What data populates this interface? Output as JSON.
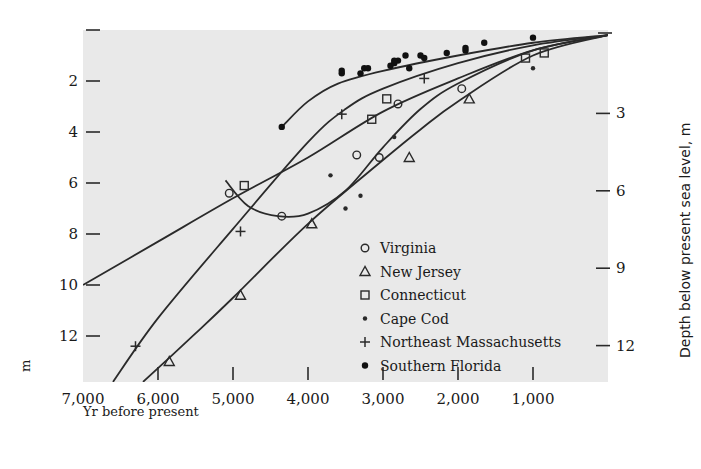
{
  "chart_data": {
    "type": "scatter",
    "title": "",
    "xlabel": "Yr before present",
    "ylabel_left": "m",
    "ylabel_right": "Depth below present sea level, m",
    "x_axis": {
      "range": [
        7000,
        0
      ],
      "reversed": true,
      "ticks": [
        7000,
        6000,
        5000,
        4000,
        3000,
        2000,
        1000
      ],
      "tick_labels": [
        "7,000",
        "6,000",
        "5,000",
        "4,000",
        "3,000",
        "2,000",
        "1,000"
      ]
    },
    "y_axis_left": {
      "range": [
        0,
        13.8
      ],
      "inverted": true,
      "ticks": [
        0,
        2,
        4,
        6,
        8,
        10,
        12
      ],
      "tick_labels": [
        "",
        "2",
        "4",
        "6",
        "8",
        "10",
        "12"
      ]
    },
    "y_axis_right": {
      "ticks": [
        3,
        6,
        9,
        12
      ],
      "tick_labels": [
        "3",
        "6",
        "9",
        "12"
      ]
    },
    "grid": false,
    "legend_position": "inside-lower-right",
    "legend": [
      {
        "name": "Virginia",
        "marker": "open-circle"
      },
      {
        "name": "New Jersey",
        "marker": "open-triangle"
      },
      {
        "name": "Connecticut",
        "marker": "open-square"
      },
      {
        "name": "Cape Cod",
        "marker": "small-dot"
      },
      {
        "name": "Northeast Massachusetts",
        "marker": "plus"
      },
      {
        "name": "Southern Florida",
        "marker": "filled-circle"
      }
    ],
    "series": [
      {
        "name": "Virginia",
        "marker": "open-circle",
        "points": [
          [
            5050,
            6.4
          ],
          [
            4350,
            7.3
          ],
          [
            3350,
            4.9
          ],
          [
            3050,
            5.0
          ],
          [
            2800,
            2.9
          ],
          [
            1950,
            2.3
          ]
        ]
      },
      {
        "name": "New Jersey",
        "marker": "open-triangle",
        "points": [
          [
            5850,
            13.0
          ],
          [
            4900,
            10.4
          ],
          [
            3950,
            7.6
          ],
          [
            2650,
            5.0
          ],
          [
            1850,
            2.7
          ]
        ]
      },
      {
        "name": "Connecticut",
        "marker": "open-square",
        "points": [
          [
            4850,
            6.1
          ],
          [
            3150,
            3.5
          ],
          [
            2950,
            2.7
          ],
          [
            1100,
            1.1
          ],
          [
            850,
            0.9
          ]
        ]
      },
      {
        "name": "Cape Cod",
        "marker": "small-dot",
        "points": [
          [
            3700,
            5.7
          ],
          [
            3300,
            6.5
          ],
          [
            2850,
            4.2
          ],
          [
            3500,
            7.0
          ],
          [
            1000,
            1.5
          ]
        ]
      },
      {
        "name": "Northeast Massachusetts",
        "marker": "plus",
        "points": [
          [
            6300,
            12.4
          ],
          [
            4900,
            7.9
          ],
          [
            3550,
            3.3
          ],
          [
            2450,
            1.9
          ]
        ]
      },
      {
        "name": "Southern Florida",
        "marker": "filled-circle",
        "points": [
          [
            4350,
            3.8
          ],
          [
            3550,
            1.7
          ],
          [
            3550,
            1.6
          ],
          [
            3300,
            1.7
          ],
          [
            3250,
            1.5
          ],
          [
            3200,
            1.5
          ],
          [
            2900,
            1.4
          ],
          [
            2850,
            1.3
          ],
          [
            2800,
            1.2
          ],
          [
            2700,
            1.0
          ],
          [
            2650,
            1.5
          ],
          [
            2500,
            1.0
          ],
          [
            2450,
            1.1
          ],
          [
            2150,
            0.9
          ],
          [
            1900,
            0.8
          ],
          [
            1900,
            0.7
          ],
          [
            1650,
            0.5
          ],
          [
            1000,
            0.3
          ],
          [
            2850,
            1.2
          ]
        ]
      }
    ],
    "curves": [
      {
        "name": "Southern Florida fit",
        "points": [
          [
            4350,
            3.8
          ],
          [
            4000,
            2.8
          ],
          [
            3600,
            2.1
          ],
          [
            3000,
            1.6
          ],
          [
            2000,
            1.0
          ],
          [
            1000,
            0.5
          ],
          [
            0,
            0.2
          ]
        ]
      },
      {
        "name": "Connecticut fit (long)",
        "points": [
          [
            7000,
            10.0
          ],
          [
            6000,
            8.3
          ],
          [
            5000,
            6.6
          ],
          [
            4000,
            5.0
          ],
          [
            3000,
            3.2
          ],
          [
            2000,
            1.9
          ],
          [
            1000,
            0.8
          ],
          [
            0,
            0.2
          ]
        ]
      },
      {
        "name": "Connecticut/Mass fit",
        "points": [
          [
            6600,
            13.8
          ],
          [
            6000,
            11.3
          ],
          [
            5000,
            7.8
          ],
          [
            4000,
            4.4
          ],
          [
            3500,
            3.1
          ],
          [
            3000,
            2.3
          ],
          [
            2000,
            1.3
          ],
          [
            1000,
            0.6
          ],
          [
            0,
            0.2
          ]
        ]
      },
      {
        "name": "Virginia fit",
        "points": [
          [
            5100,
            5.9
          ],
          [
            4800,
            6.9
          ],
          [
            4400,
            7.3
          ],
          [
            4000,
            7.2
          ],
          [
            3500,
            6.3
          ],
          [
            3000,
            4.6
          ],
          [
            2500,
            3.1
          ],
          [
            2000,
            2.1
          ],
          [
            1000,
            0.8
          ],
          [
            0,
            0.2
          ]
        ]
      },
      {
        "name": "New Jersey fit",
        "points": [
          [
            6200,
            13.8
          ],
          [
            5500,
            11.9
          ],
          [
            5000,
            10.5
          ],
          [
            4000,
            7.6
          ],
          [
            3000,
            5.1
          ],
          [
            2500,
            3.9
          ],
          [
            2000,
            2.8
          ],
          [
            1000,
            1.0
          ],
          [
            0,
            0.2
          ]
        ]
      }
    ]
  },
  "labels": {
    "x_axis_title": "Yr before present",
    "left_unit": "m",
    "right_axis_title": "Depth below present sea level, m"
  },
  "colors": {
    "plot_background": "#e9e9e9",
    "ink": "#2a2a2a",
    "page_background": "#ffffff"
  }
}
